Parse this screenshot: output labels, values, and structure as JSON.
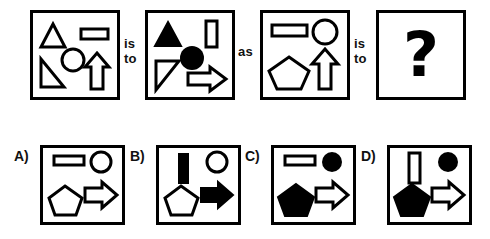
{
  "puzzle": {
    "type": "visual-analogy-matrix",
    "connectors": {
      "is_to_1": "is\nto",
      "as": "as",
      "is_to_2": "is\nto"
    },
    "question_mark": "?",
    "top_row": [
      {
        "id": "A",
        "name": "source-panel-1",
        "shapes": [
          {
            "shape": "triangle",
            "fill": "outline",
            "position": "top-left",
            "orientation": "up"
          },
          {
            "shape": "rectangle",
            "fill": "outline",
            "position": "top-right",
            "orientation": "horizontal"
          },
          {
            "shape": "circle",
            "fill": "outline",
            "position": "center"
          },
          {
            "shape": "right-triangle",
            "fill": "outline",
            "position": "bottom-left",
            "orientation": "right-angle-bottom-right"
          },
          {
            "shape": "arrow",
            "fill": "outline",
            "position": "bottom-right",
            "orientation": "up"
          }
        ]
      },
      {
        "id": "B",
        "name": "target-panel-1",
        "shapes": [
          {
            "shape": "triangle",
            "fill": "solid",
            "position": "top-left",
            "orientation": "up"
          },
          {
            "shape": "rectangle",
            "fill": "outline",
            "position": "top-right",
            "orientation": "vertical"
          },
          {
            "shape": "circle",
            "fill": "solid",
            "position": "center"
          },
          {
            "shape": "right-triangle",
            "fill": "outline",
            "position": "bottom-left",
            "orientation": "right-angle-bottom-left"
          },
          {
            "shape": "arrow",
            "fill": "outline",
            "position": "bottom-right",
            "orientation": "right"
          }
        ]
      },
      {
        "id": "C",
        "name": "source-panel-2",
        "shapes": [
          {
            "shape": "rectangle",
            "fill": "outline",
            "position": "top-left",
            "orientation": "horizontal"
          },
          {
            "shape": "circle",
            "fill": "outline",
            "position": "top-right"
          },
          {
            "shape": "pentagon",
            "fill": "outline",
            "position": "bottom-left"
          },
          {
            "shape": "arrow",
            "fill": "outline",
            "position": "bottom-right",
            "orientation": "up"
          }
        ]
      },
      {
        "id": "D",
        "name": "answer-panel",
        "shapes": [],
        "content": "question-mark"
      }
    ],
    "options": [
      {
        "label": "A)",
        "key": "A",
        "shapes": [
          {
            "shape": "rectangle",
            "fill": "outline",
            "position": "top-left",
            "orientation": "horizontal"
          },
          {
            "shape": "circle",
            "fill": "outline",
            "position": "top-right"
          },
          {
            "shape": "pentagon",
            "fill": "outline",
            "position": "bottom-left"
          },
          {
            "shape": "arrow",
            "fill": "outline",
            "position": "bottom-right",
            "orientation": "right"
          }
        ]
      },
      {
        "label": "B)",
        "key": "B",
        "shapes": [
          {
            "shape": "rectangle",
            "fill": "solid",
            "position": "top-left",
            "orientation": "vertical"
          },
          {
            "shape": "circle",
            "fill": "outline",
            "position": "top-right"
          },
          {
            "shape": "pentagon",
            "fill": "outline",
            "position": "bottom-left"
          },
          {
            "shape": "arrow",
            "fill": "solid",
            "position": "bottom-right",
            "orientation": "right"
          }
        ]
      },
      {
        "label": "C)",
        "key": "C",
        "shapes": [
          {
            "shape": "rectangle",
            "fill": "outline",
            "position": "top-left",
            "orientation": "horizontal"
          },
          {
            "shape": "circle",
            "fill": "solid",
            "position": "top-right"
          },
          {
            "shape": "pentagon",
            "fill": "solid",
            "position": "bottom-left"
          },
          {
            "shape": "arrow",
            "fill": "outline",
            "position": "bottom-right",
            "orientation": "right"
          }
        ]
      },
      {
        "label": "D)",
        "key": "D",
        "shapes": [
          {
            "shape": "rectangle",
            "fill": "outline",
            "position": "top-left",
            "orientation": "vertical"
          },
          {
            "shape": "circle",
            "fill": "solid",
            "position": "top-right"
          },
          {
            "shape": "pentagon",
            "fill": "solid",
            "position": "bottom-left"
          },
          {
            "shape": "arrow",
            "fill": "outline",
            "position": "bottom-right",
            "orientation": "right"
          }
        ]
      }
    ]
  },
  "colors": {
    "ink": "#000000",
    "paper": "#ffffff"
  }
}
